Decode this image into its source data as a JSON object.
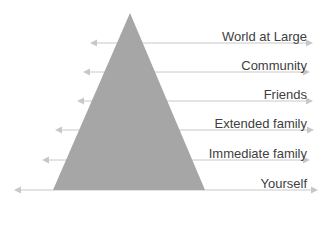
{
  "diagram": {
    "type": "pyramid-with-arrows",
    "triangle": {
      "color": "#a6a6a6",
      "apex": [
        130,
        13
      ],
      "base_left": [
        53,
        190
      ],
      "base_right": [
        205,
        190
      ]
    },
    "arrow_color": "#c8c8c8",
    "levels": [
      {
        "label": "World at Large",
        "y": 43,
        "left": 90,
        "right": 313,
        "label_top": 2
      },
      {
        "label": "Community",
        "y": 72,
        "left": 83,
        "right": 310,
        "label_top": 31
      },
      {
        "label": "Friends",
        "y": 101,
        "left": 77,
        "right": 313,
        "label_top": 60
      },
      {
        "label": "Extended family",
        "y": 130,
        "left": 55,
        "right": 314,
        "label_top": 89
      },
      {
        "label": "Immediate family",
        "y": 160,
        "left": 42,
        "right": 310,
        "label_top": 119
      },
      {
        "label": "Yourself",
        "y": 190,
        "left": 14,
        "right": 318,
        "label_top": 149
      }
    ]
  }
}
